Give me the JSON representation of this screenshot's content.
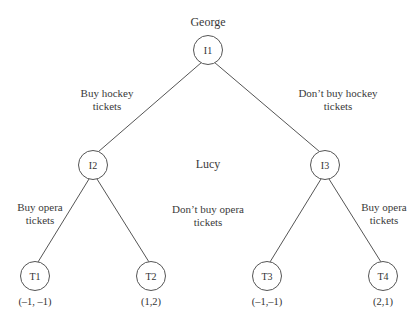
{
  "diagram": {
    "type": "game-tree",
    "players": {
      "first": "George",
      "second": "Lucy"
    },
    "nodes": {
      "root": {
        "label": "I1"
      },
      "left": {
        "label": "I2"
      },
      "right": {
        "label": "I3"
      },
      "leaves": [
        {
          "label": "T1",
          "payoff": "(–1, –1)"
        },
        {
          "label": "T2",
          "payoff": "(1,2)"
        },
        {
          "label": "T3",
          "payoff": "(–1,–1)"
        },
        {
          "label": "T4",
          "payoff": "(2,1)"
        }
      ]
    },
    "branches": {
      "buy_hockey": {
        "line1": "Buy hockey",
        "line2": "tickets"
      },
      "dont_buy_hockey": {
        "line1": "Don’t buy hockey",
        "line2": "tickets"
      },
      "buy_opera_left": {
        "line1": "Buy opera",
        "line2": "tickets"
      },
      "dont_buy_opera": {
        "line1": "Don’t buy opera",
        "line2": "tickets"
      },
      "buy_opera_right": {
        "line1": "Buy opera",
        "line2": "tickets"
      }
    },
    "colors": {
      "line": "#555555",
      "text": "#333333",
      "background": "#ffffff"
    }
  }
}
